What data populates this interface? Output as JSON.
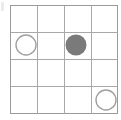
{
  "board": {
    "title": "4x4 grid puzzle board",
    "rows": 4,
    "cols": 4,
    "cell_width": 27,
    "cell_height": 27.25,
    "origin_x": 10,
    "origin_y": 5,
    "line_color": "#a8a8a8",
    "border_color": "#9a9a9a",
    "background_color": "#ffffff"
  },
  "markers": [
    {
      "name": "marker-open-r2c1",
      "type": "open-circle",
      "row": 2,
      "col": 1,
      "cx": 26,
      "cy": 45,
      "r": 10,
      "stroke": "#a0a0a0",
      "fill": "none",
      "label": "open circle"
    },
    {
      "name": "marker-filled-r2c3",
      "type": "filled-circle",
      "row": 2,
      "col": 3,
      "cx": 76,
      "cy": 45,
      "r": 10.5,
      "stroke": "none",
      "fill": "#7a7a7a",
      "label": "filled circle"
    },
    {
      "name": "marker-open-r4c4",
      "type": "open-circle",
      "row": 4,
      "col": 4,
      "cx": 106,
      "cy": 100,
      "r": 10,
      "stroke": "#a0a0a0",
      "fill": "none",
      "label": "open circle"
    }
  ],
  "artifact": {
    "name": "edge-speck",
    "color": "#e6e6e6"
  }
}
